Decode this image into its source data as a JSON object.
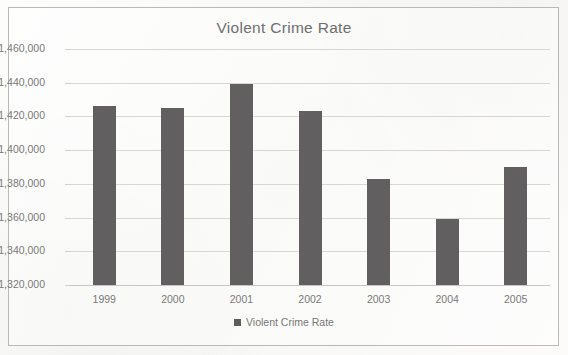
{
  "chart_data": {
    "type": "bar",
    "title": "Violent Crime Rate",
    "xlabel": "",
    "ylabel": "",
    "categories": [
      "1999",
      "2000",
      "2001",
      "2002",
      "2003",
      "2004",
      "2005"
    ],
    "series": [
      {
        "name": "Violent Crime Rate",
        "values": [
          1426000,
          1425000,
          1439000,
          1423000,
          1383000,
          1359000,
          1390000
        ]
      }
    ],
    "ylim": [
      1320000,
      1460000
    ],
    "ytick_step": 20000,
    "ytick_labels": [
      "1,460,000",
      "1,440,000",
      "1,420,000",
      "1,400,000",
      "1,380,000",
      "1,360,000",
      "1,340,000",
      "1,320,000"
    ],
    "grid": true,
    "legend": {
      "position": "bottom",
      "entries": [
        "Violent Crime Rate"
      ]
    },
    "colors": {
      "bar": "#615f5f",
      "gridline": "#d7d7d5",
      "axis_text": "#7a7a78",
      "title_text": "#6f6f6f",
      "frame_border": "#b9b9b7",
      "background": "#fbfbfa"
    }
  }
}
